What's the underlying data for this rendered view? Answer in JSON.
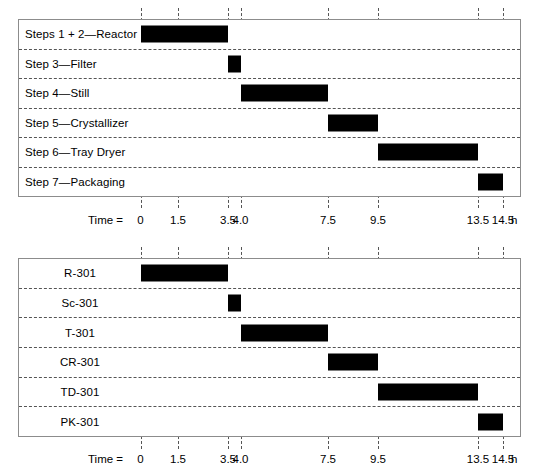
{
  "chart_data": [
    {
      "type": "bar",
      "subtype": "gantt",
      "title": "",
      "xlabel": "Time = 0 ... h",
      "ylabel": "",
      "xlim": [
        -0.6,
        15.5
      ],
      "grid": true,
      "legend": "none",
      "axis_caption": "Time = ",
      "axis_unit": "h",
      "tick_labels": [
        "0",
        "1.5",
        "3.5",
        "4.0",
        "7.5",
        "9.5",
        "13.5",
        "14.5"
      ],
      "tick_values": [
        0,
        1.5,
        3.5,
        4.0,
        7.5,
        9.5,
        13.5,
        14.5
      ],
      "categories": [
        "Steps 1 + 2—Reactor",
        "Step 3—Filter",
        "Step 4—Still",
        "Step 5—Crystallizer",
        "Step 6—Tray Dryer",
        "Step 7—Packaging"
      ],
      "bars": [
        {
          "label": "Steps 1 + 2—Reactor",
          "start": 0.0,
          "end": 3.5,
          "duration": 3.5
        },
        {
          "label": "Step 3—Filter",
          "start": 3.5,
          "end": 4.0,
          "duration": 0.5
        },
        {
          "label": "Step 4—Still",
          "start": 4.0,
          "end": 7.5,
          "duration": 3.5
        },
        {
          "label": "Step 5—Crystallizer",
          "start": 7.5,
          "end": 9.5,
          "duration": 2.0
        },
        {
          "label": "Step 6—Tray Dryer",
          "start": 9.5,
          "end": 13.5,
          "duration": 4.0
        },
        {
          "label": "Step 7—Packaging",
          "start": 13.5,
          "end": 14.5,
          "duration": 1.0
        }
      ],
      "bar_color": "#000000",
      "grid_color": "#555555",
      "frame_color": "#8c8c8c"
    },
    {
      "type": "bar",
      "subtype": "gantt",
      "title": "",
      "xlabel": "Time = 0 ... h",
      "ylabel": "",
      "xlim": [
        -0.6,
        15.5
      ],
      "grid": true,
      "legend": "none",
      "axis_caption": "Time = ",
      "axis_unit": "h",
      "tick_labels": [
        "0",
        "1.5",
        "3.5",
        "4.0",
        "7.5",
        "9.5",
        "13.5",
        "14.5"
      ],
      "tick_values": [
        0,
        1.5,
        3.5,
        4.0,
        7.5,
        9.5,
        13.5,
        14.5
      ],
      "categories": [
        "R-301",
        "Sc-301",
        "T-301",
        "CR-301",
        "TD-301",
        "PK-301"
      ],
      "bars": [
        {
          "label": "R-301",
          "start": 0.0,
          "end": 3.5,
          "duration": 3.5
        },
        {
          "label": "Sc-301",
          "start": 3.5,
          "end": 4.0,
          "duration": 0.5
        },
        {
          "label": "T-301",
          "start": 4.0,
          "end": 7.5,
          "duration": 3.5
        },
        {
          "label": "CR-301",
          "start": 7.5,
          "end": 9.5,
          "duration": 2.0
        },
        {
          "label": "TD-301",
          "start": 9.5,
          "end": 13.5,
          "duration": 4.0
        },
        {
          "label": "PK-301",
          "start": 13.5,
          "end": 14.5,
          "duration": 1.0
        }
      ],
      "bar_color": "#000000",
      "grid_color": "#555555",
      "frame_color": "#8c8c8c"
    }
  ],
  "geometry": {
    "x0_px": 140.5,
    "px_per_hour": 25.0,
    "axis_caption_x_px": 88,
    "axis_unit_x_px": 511
  }
}
